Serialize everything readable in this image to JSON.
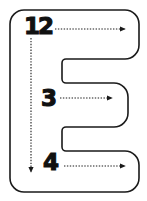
{
  "figure": {
    "kind": "letter-stroke-order-diagram",
    "letter": "E",
    "background_color": "#ffffff",
    "outline_color": "#1a1a1a",
    "number_color": "#111111",
    "arrow_color": "#1a1a1a"
  },
  "strokes": [
    {
      "order": "1",
      "label": "1",
      "direction": "down",
      "arrow_name": "stroke-1-arrow-down",
      "start": [
        31,
        38
      ],
      "end": [
        31,
        173
      ]
    },
    {
      "order": "2",
      "label": "2",
      "direction": "right",
      "arrow_name": "stroke-2-arrow-right",
      "start": [
        55,
        29
      ],
      "end": [
        126,
        29
      ]
    },
    {
      "order": "3",
      "label": "3",
      "direction": "right",
      "arrow_name": "stroke-3-arrow-right",
      "start": [
        60,
        98
      ],
      "end": [
        113,
        98
      ]
    },
    {
      "order": "4",
      "label": "4",
      "direction": "right",
      "arrow_name": "stroke-4-arrow-right",
      "start": [
        64,
        166
      ],
      "end": [
        126,
        166
      ]
    }
  ],
  "outline": {
    "name": "letter-e-outline",
    "path": "M 24 10 L 125 10 A 14 14 0 0 1 139 24 L 139 45 A 14 14 0 0 1 125 59 L 66 59 A 4 4 0 0 0 62 63 L 62 79 A 4 4 0 0 0 66 83 L 114 83 A 14 14 0 0 1 128 97 L 128 113 A 14 14 0 0 1 114 127 L 66 127 A 4 4 0 0 0 62 131 L 62 147 A 4 4 0 0 0 66 151 L 125 151 A 14 14 0 0 1 139 165 L 139 178 A 14 14 0 0 1 125 192 L 24 192 A 14 14 0 0 1 10 178 L 10 24 A 14 14 0 0 1 24 10 Z",
    "stroke_width": 1.6
  }
}
